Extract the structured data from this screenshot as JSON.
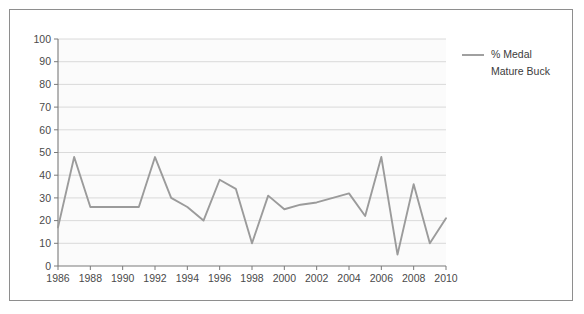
{
  "figure": {
    "border_color": "#8e8e8e",
    "background": "#ffffff"
  },
  "chart_data": {
    "type": "line",
    "title": "",
    "subtitle": "",
    "xlabel": "",
    "ylabel": "",
    "xlim": [
      1986,
      2010
    ],
    "ylim": [
      0,
      100
    ],
    "grid": true,
    "grid_axis": "y",
    "legend_position": "right",
    "line_color": "#9b9b9b",
    "categories": [
      1986,
      1987,
      1988,
      1989,
      1990,
      1991,
      1992,
      1993,
      1994,
      1995,
      1996,
      1997,
      1998,
      1999,
      2000,
      2001,
      2002,
      2003,
      2004,
      2005,
      2006,
      2007,
      2008,
      2009,
      2010
    ],
    "series": [
      {
        "name": "% Medal Mature Buck",
        "values": [
          17,
          48,
          26,
          26,
          26,
          26,
          48,
          30,
          26,
          20,
          38,
          34,
          10,
          31,
          25,
          27,
          28,
          30,
          32,
          22,
          48,
          5,
          36,
          10,
          21
        ]
      }
    ],
    "ytick_labels": [
      "0",
      "10",
      "20",
      "30",
      "40",
      "50",
      "60",
      "70",
      "80",
      "90",
      "100"
    ],
    "ytick_values": [
      0,
      10,
      20,
      30,
      40,
      50,
      60,
      70,
      80,
      90,
      100
    ],
    "xtick_labels": [
      "1986",
      "1988",
      "1990",
      "1992",
      "1994",
      "1996",
      "1998",
      "2000",
      "2002",
      "2004",
      "2006",
      "2008",
      "2010"
    ],
    "xtick_values": [
      1986,
      1988,
      1990,
      1992,
      1994,
      1996,
      1998,
      2000,
      2002,
      2004,
      2006,
      2008,
      2010
    ]
  },
  "legend": {
    "entries": [
      {
        "label_line1": "% Medal",
        "label_line2": "Mature Buck",
        "color": "#9b9b9b"
      }
    ]
  }
}
